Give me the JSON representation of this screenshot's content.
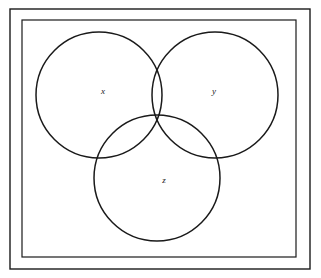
{
  "figure": {
    "type": "venn-diagram",
    "set_count": 3,
    "background_color": "#ffffff",
    "stroke_color": "#1a1a1a",
    "label_color": "#1a1a1a"
  },
  "frame": {
    "outer": {
      "x": 10,
      "y": 9,
      "width": 300,
      "height": 260,
      "stroke_width": 1.4
    },
    "inner": {
      "x": 22,
      "y": 20,
      "width": 274,
      "height": 237,
      "stroke_width": 1.2
    }
  },
  "circles": [
    {
      "id": "x",
      "label": "x",
      "cx": 99,
      "cy": 95,
      "r": 63,
      "stroke_width": 1.5
    },
    {
      "id": "y",
      "label": "y",
      "cx": 215,
      "cy": 95,
      "r": 63,
      "stroke_width": 1.5
    },
    {
      "id": "z",
      "label": "z",
      "cx": 157,
      "cy": 178,
      "r": 63,
      "stroke_width": 1.5
    }
  ],
  "labels": [
    {
      "id": "x",
      "text": "x",
      "x": 103,
      "y": 92
    },
    {
      "id": "y",
      "text": "y",
      "x": 214,
      "y": 92
    },
    {
      "id": "z",
      "text": "z",
      "x": 164,
      "y": 181
    }
  ]
}
